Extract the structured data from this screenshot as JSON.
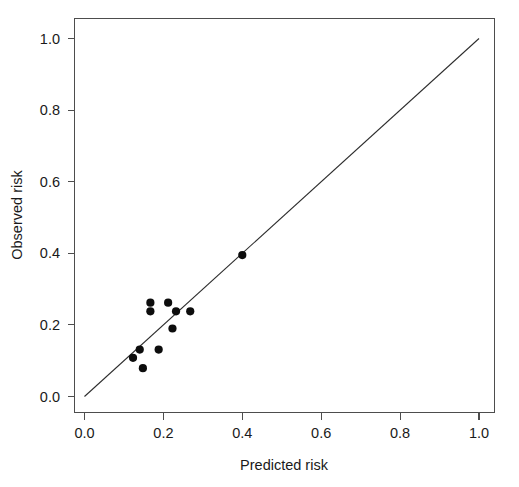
{
  "chart_data": {
    "type": "scatter",
    "title": "",
    "subtitle": "",
    "xlabel": "Predicted risk",
    "ylabel": "Observed risk",
    "xlim": [
      0.0,
      1.0
    ],
    "ylim": [
      0.0,
      1.0
    ],
    "grid": false,
    "legend": null,
    "legend_position": "none",
    "x_ticks": [
      0.0,
      0.2,
      0.4,
      0.6,
      0.8,
      1.0
    ],
    "y_ticks": [
      0.0,
      0.2,
      0.4,
      0.6,
      0.8,
      1.0
    ],
    "x_tick_labels": [
      "0.0",
      "0.2",
      "0.4",
      "0.6",
      "0.8",
      "1.0"
    ],
    "y_tick_labels": [
      "0.0",
      "0.2",
      "0.4",
      "0.6",
      "0.8",
      "1.0"
    ],
    "series": [
      {
        "name": "Calibration points",
        "marker": "filled-circle",
        "color": "#0d0d0d",
        "x": [
          0.123,
          0.14,
          0.148,
          0.167,
          0.167,
          0.188,
          0.212,
          0.223,
          0.232,
          0.268,
          0.4
        ],
        "y": [
          0.108,
          0.131,
          0.079,
          0.262,
          0.238,
          0.131,
          0.262,
          0.19,
          0.238,
          0.238,
          0.395
        ],
        "points": [
          {
            "x": 0.123,
            "y": 0.108
          },
          {
            "x": 0.14,
            "y": 0.131
          },
          {
            "x": 0.148,
            "y": 0.079
          },
          {
            "x": 0.167,
            "y": 0.262
          },
          {
            "x": 0.167,
            "y": 0.238
          },
          {
            "x": 0.188,
            "y": 0.131
          },
          {
            "x": 0.212,
            "y": 0.262
          },
          {
            "x": 0.223,
            "y": 0.19
          },
          {
            "x": 0.232,
            "y": 0.238
          },
          {
            "x": 0.268,
            "y": 0.238
          },
          {
            "x": 0.4,
            "y": 0.395
          }
        ]
      },
      {
        "name": "Reference diagonal",
        "marker": "none",
        "type": "line",
        "color": "#2b2b2b",
        "x": [
          0.0,
          1.0
        ],
        "y": [
          0.0,
          1.0
        ]
      }
    ],
    "annotations": []
  },
  "axes": {
    "x_title": "Predicted risk",
    "y_title": "Observed risk"
  },
  "colors": {
    "point": "#0d0d0d",
    "line": "#2b2b2b",
    "frame": "#4d4d4d",
    "background": "#ffffff",
    "text": "#1a1a1a"
  }
}
